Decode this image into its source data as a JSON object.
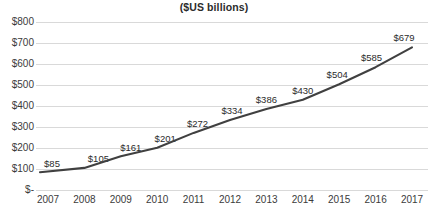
{
  "chart_data": {
    "type": "line",
    "title": "($US billions)",
    "xlabel": "",
    "ylabel": "",
    "categories": [
      "2007",
      "2008",
      "2009",
      "2010",
      "2011",
      "2012",
      "2013",
      "2014",
      "2015",
      "2016",
      "2017"
    ],
    "values": [
      85,
      105,
      161,
      201,
      272,
      334,
      386,
      430,
      504,
      585,
      679
    ],
    "point_labels": [
      "$85",
      "$105",
      "$161",
      "$201",
      "$272",
      "$334",
      "$386",
      "$430",
      "$504",
      "$585",
      "$679"
    ],
    "ylim": [
      0,
      800
    ],
    "ytick_values": [
      800,
      700,
      600,
      500,
      400,
      300,
      200,
      100,
      0
    ],
    "ytick_labels": [
      "$800",
      "$700",
      "$600",
      "$500",
      "$400",
      "$300",
      "$200",
      "$100",
      "$-"
    ],
    "grid": true,
    "legend": "none",
    "series": [
      {
        "name": "",
        "values": [
          85,
          105,
          161,
          201,
          272,
          334,
          386,
          430,
          504,
          585,
          679
        ],
        "color": "#404040"
      }
    ],
    "colors": {
      "line": "#404040",
      "gridline": "#d9d9d9",
      "text": "#3b3b3b",
      "background": "#ffffff"
    }
  }
}
